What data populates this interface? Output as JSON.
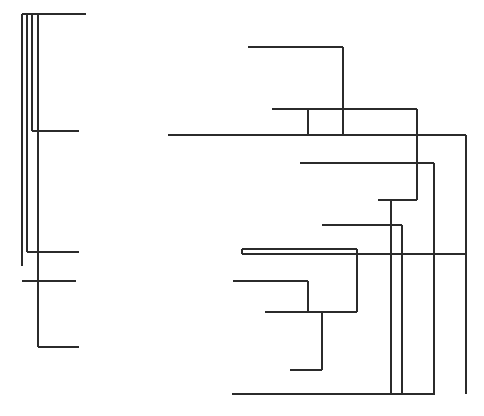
{
  "figure": {
    "type": "dendrogram",
    "title": "",
    "width": 484,
    "height": 416,
    "background_color": "#ffffff",
    "line_color": "#2b2b2b",
    "line_width": 1.6
  },
  "chart_data": {
    "type": "line",
    "title": "",
    "subtitle": "",
    "xlabel": "",
    "ylabel": "",
    "xlim": [
      0,
      484
    ],
    "ylim": [
      0,
      416
    ],
    "grid": false,
    "legend": "none",
    "tick_labels_x": [],
    "tick_labels_y": [],
    "annotations": [],
    "clusters": [
      {
        "name": "left-cluster",
        "segments": [
          {
            "id": "L1",
            "orientation": "horizontal",
            "x1": 22,
            "y1": 14,
            "x2": 86,
            "y2": 14
          },
          {
            "id": "L2",
            "orientation": "vertical",
            "x1": 22,
            "y1": 14,
            "x2": 22,
            "y2": 266
          },
          {
            "id": "L3",
            "orientation": "vertical",
            "x1": 27,
            "y1": 14,
            "x2": 27,
            "y2": 252
          },
          {
            "id": "L4",
            "orientation": "vertical",
            "x1": 32,
            "y1": 14,
            "x2": 32,
            "y2": 131
          },
          {
            "id": "L5",
            "orientation": "vertical",
            "x1": 38,
            "y1": 14,
            "x2": 38,
            "y2": 347
          },
          {
            "id": "L6",
            "orientation": "horizontal",
            "x1": 32,
            "y1": 131,
            "x2": 79,
            "y2": 131
          },
          {
            "id": "L7",
            "orientation": "horizontal",
            "x1": 27,
            "y1": 252,
            "x2": 79,
            "y2": 252
          },
          {
            "id": "L8",
            "orientation": "horizontal",
            "x1": 22,
            "y1": 281,
            "x2": 76,
            "y2": 281
          },
          {
            "id": "L9",
            "orientation": "horizontal",
            "x1": 38,
            "y1": 347,
            "x2": 79,
            "y2": 347
          }
        ]
      },
      {
        "name": "right-cluster",
        "segments": [
          {
            "id": "R1",
            "orientation": "horizontal",
            "x1": 248,
            "y1": 47,
            "x2": 343,
            "y2": 47
          },
          {
            "id": "R2",
            "orientation": "vertical",
            "x1": 343,
            "y1": 47,
            "x2": 343,
            "y2": 135
          },
          {
            "id": "R3",
            "orientation": "horizontal",
            "x1": 272,
            "y1": 109,
            "x2": 417,
            "y2": 109
          },
          {
            "id": "R4",
            "orientation": "vertical",
            "x1": 308,
            "y1": 109,
            "x2": 308,
            "y2": 135
          },
          {
            "id": "R5",
            "orientation": "vertical",
            "x1": 417,
            "y1": 109,
            "x2": 417,
            "y2": 200
          },
          {
            "id": "R6",
            "orientation": "horizontal",
            "x1": 168,
            "y1": 135,
            "x2": 466,
            "y2": 135
          },
          {
            "id": "R7",
            "orientation": "vertical",
            "x1": 466,
            "y1": 135,
            "x2": 466,
            "y2": 394
          },
          {
            "id": "R8",
            "orientation": "horizontal",
            "x1": 300,
            "y1": 163,
            "x2": 434,
            "y2": 163
          },
          {
            "id": "R9",
            "orientation": "vertical",
            "x1": 434,
            "y1": 163,
            "x2": 434,
            "y2": 394
          },
          {
            "id": "R10",
            "orientation": "horizontal",
            "x1": 378,
            "y1": 200,
            "x2": 417,
            "y2": 200
          },
          {
            "id": "R11",
            "orientation": "vertical",
            "x1": 391,
            "y1": 200,
            "x2": 391,
            "y2": 394
          },
          {
            "id": "R12",
            "orientation": "horizontal",
            "x1": 322,
            "y1": 225,
            "x2": 402,
            "y2": 225
          },
          {
            "id": "R13",
            "orientation": "vertical",
            "x1": 402,
            "y1": 225,
            "x2": 402,
            "y2": 394
          },
          {
            "id": "R14",
            "orientation": "horizontal",
            "x1": 242,
            "y1": 249,
            "x2": 357,
            "y2": 249
          },
          {
            "id": "R15",
            "orientation": "horizontal",
            "x1": 242,
            "y1": 254,
            "x2": 466,
            "y2": 254
          },
          {
            "id": "R16",
            "orientation": "vertical",
            "x1": 242,
            "y1": 249,
            "x2": 242,
            "y2": 254
          },
          {
            "id": "R17",
            "orientation": "vertical",
            "x1": 357,
            "y1": 249,
            "x2": 357,
            "y2": 312
          },
          {
            "id": "R18",
            "orientation": "horizontal",
            "x1": 233,
            "y1": 281,
            "x2": 308,
            "y2": 281
          },
          {
            "id": "R19",
            "orientation": "vertical",
            "x1": 308,
            "y1": 281,
            "x2": 308,
            "y2": 312
          },
          {
            "id": "R20",
            "orientation": "horizontal",
            "x1": 265,
            "y1": 312,
            "x2": 357,
            "y2": 312
          },
          {
            "id": "R21",
            "orientation": "vertical",
            "x1": 322,
            "y1": 312,
            "x2": 322,
            "y2": 370
          },
          {
            "id": "R22",
            "orientation": "horizontal",
            "x1": 290,
            "y1": 370,
            "x2": 322,
            "y2": 370
          },
          {
            "id": "R23",
            "orientation": "horizontal",
            "x1": 232,
            "y1": 394,
            "x2": 435,
            "y2": 394
          }
        ]
      }
    ]
  }
}
